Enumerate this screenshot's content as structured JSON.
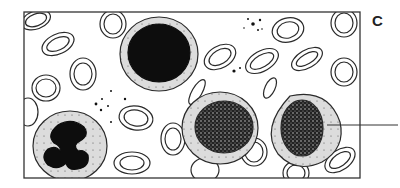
{
  "figure": {
    "panel_label": "C",
    "cells": [
      {
        "type": "red-blood-cell",
        "count": 24
      },
      {
        "type": "lymphocyte",
        "description": "large dark round nucleus with thin granular cytoplasm rim"
      },
      {
        "type": "neutrophil",
        "description": "multi-lobed dark nucleus with speckled cytoplasm"
      },
      {
        "type": "mononuclear-cell",
        "description": "round stippled nucleus, pale cytoplasm",
        "count": 2
      },
      {
        "type": "platelets",
        "count": 3
      }
    ],
    "leader_line": true,
    "colors": {
      "outline": "#2a2a2a",
      "cytoplasm": "#d9d9d9",
      "nucleus": "#111111",
      "background": "#ffffff"
    }
  }
}
